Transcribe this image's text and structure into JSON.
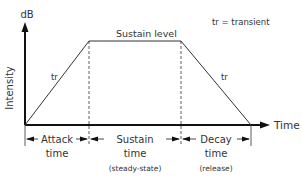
{
  "diagram": {
    "type": "ADSR-style envelope (attack, sustain, decay)",
    "y_axis": {
      "unit": "dB",
      "label": "Intensity"
    },
    "x_axis": {
      "label": "Time"
    },
    "legend": "tr = transient",
    "curve_labels": {
      "sustain_level": "Sustain level",
      "attack_transient": "tr",
      "decay_transient": "tr"
    },
    "phases": [
      {
        "name": "attack",
        "label_line1": "Attack",
        "label_line2": "time",
        "note": ""
      },
      {
        "name": "sustain",
        "label_line1": "Sustain",
        "label_line2": "time",
        "note": "(steady-state)"
      },
      {
        "name": "decay",
        "label_line1": "Decay",
        "label_line2": "time",
        "note": "(release)"
      }
    ]
  },
  "colors": {
    "line": "#2b2b2b",
    "text": "#333333",
    "background": "#ffffff"
  }
}
